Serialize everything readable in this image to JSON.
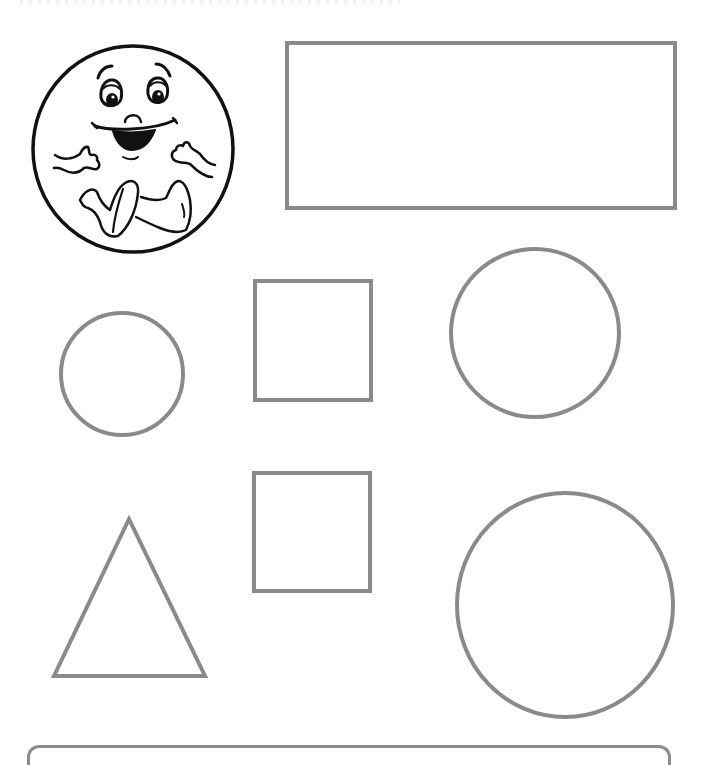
{
  "page": {
    "background": "#ffffff"
  },
  "style": {
    "shape_stroke": "#8a8a8a",
    "shape_stroke_width": 4,
    "face_stroke": "#111111",
    "face_fill": "#ffffff"
  },
  "mascot": {
    "label": "Smiling round character",
    "cx": 133,
    "cy": 149,
    "rx": 100,
    "ry": 103
  },
  "shapes": [
    {
      "id": "rectangle",
      "type": "rect",
      "x": 287,
      "y": 43,
      "w": 388,
      "h": 165
    },
    {
      "id": "small-circle",
      "type": "circle",
      "cx": 122,
      "cy": 374,
      "r": 61
    },
    {
      "id": "square-1",
      "type": "rect",
      "x": 255,
      "y": 281,
      "w": 116,
      "h": 119
    },
    {
      "id": "medium-circle",
      "type": "circle",
      "cx": 535,
      "cy": 333,
      "r": 84
    },
    {
      "id": "triangle",
      "type": "polygon",
      "points": "129,519 54,676 205,676"
    },
    {
      "id": "square-2",
      "type": "rect",
      "x": 254,
      "y": 473,
      "w": 116,
      "h": 118
    },
    {
      "id": "large-circle",
      "type": "ellipse",
      "cx": 565,
      "cy": 605,
      "rx": 108,
      "ry": 112
    }
  ]
}
